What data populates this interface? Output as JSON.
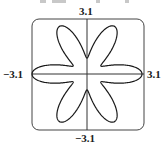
{
  "chart_data": {
    "type": "line",
    "subtype": "polar-curve",
    "title": "",
    "equation_form": "r = 2 + 1.1 cos(6θ)",
    "petals": 6,
    "petal_angles_deg": [
      0,
      60,
      120,
      180,
      240,
      300
    ],
    "r_max": 3.1,
    "r_min": 0.9,
    "xlim": [
      -3.1,
      3.1
    ],
    "ylim": [
      -3.1,
      3.1
    ],
    "axes": {
      "x_axis_line": true,
      "y_axis_line": true,
      "frame": "rounded-square"
    },
    "grid": false,
    "legend": null,
    "tick_labels": {
      "top": "3.1",
      "bottom": "−3.1",
      "left": "−3.1",
      "right": "3.1"
    },
    "line_color": "#1a1a1a",
    "frame_color": "#444444"
  }
}
